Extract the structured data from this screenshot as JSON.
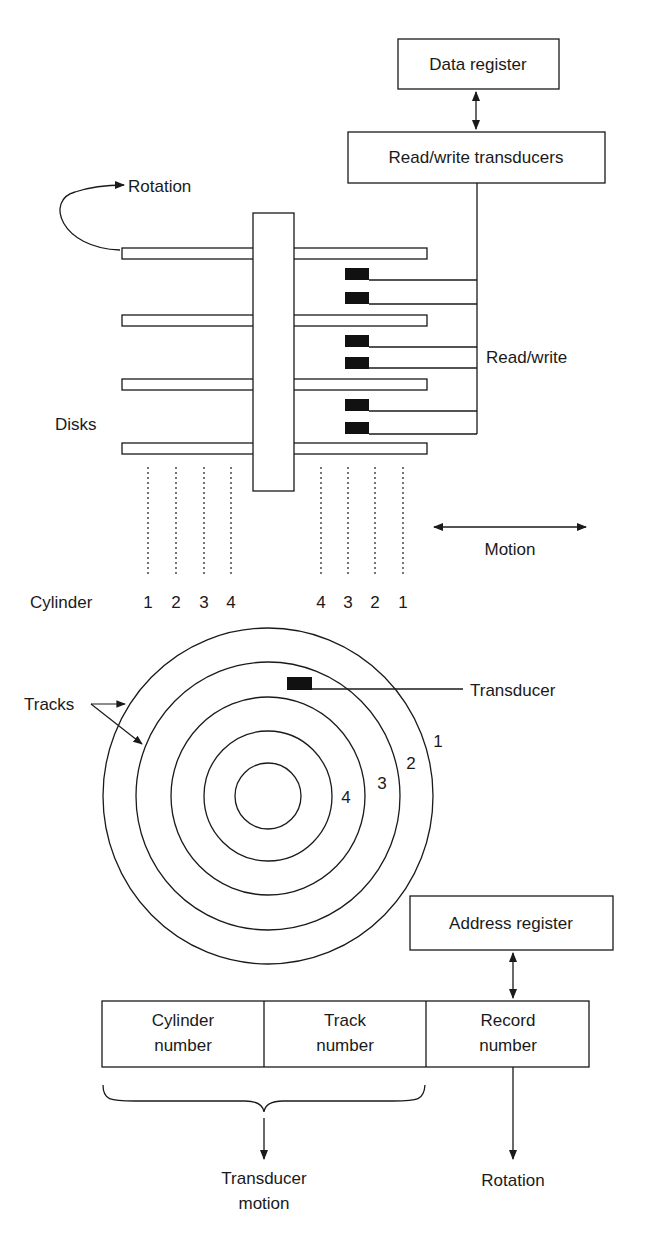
{
  "boxes": {
    "data_register": "Data register",
    "rw_transducers": "Read/write transducers",
    "address_register": "Address register"
  },
  "labels": {
    "rotation_top": "Rotation",
    "read_write": "Read/write",
    "disks": "Disks",
    "motion": "Motion",
    "cylinder": "Cylinder",
    "tracks": "Tracks",
    "transducer": "Transducer",
    "transducer_motion_line1": "Transducer",
    "transducer_motion_line2": "motion",
    "rotation_bottom": "Rotation"
  },
  "cylinder_numbers_left": [
    "1",
    "2",
    "3",
    "4"
  ],
  "cylinder_numbers_right": [
    "4",
    "3",
    "2",
    "1"
  ],
  "track_numbers": [
    "1",
    "2",
    "3",
    "4"
  ],
  "address_fields": [
    {
      "line1": "Cylinder",
      "line2": "number"
    },
    {
      "line1": "Track",
      "line2": "number"
    },
    {
      "line1": "Record",
      "line2": "number"
    }
  ],
  "colors": {
    "stroke": "#1a1a1a",
    "head_fill": "#111111",
    "background": "#ffffff"
  }
}
